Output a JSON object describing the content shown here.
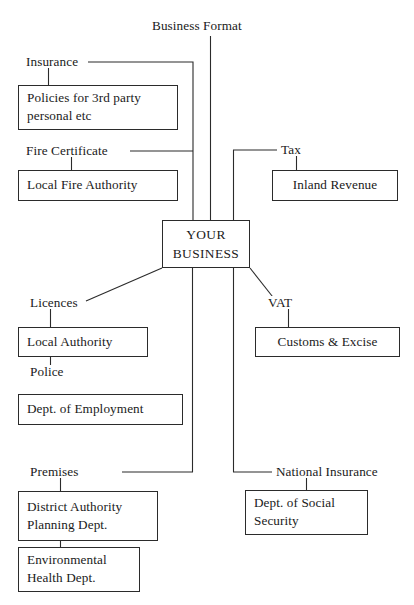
{
  "diagram": {
    "center": {
      "line1": "YOUR",
      "line2": "BUSINESS"
    },
    "labels": {
      "business_format": "Business Format",
      "insurance": "Insurance",
      "fire_certificate": "Fire Certificate",
      "tax": "Tax",
      "licences": "Licences",
      "police": "Police",
      "vat": "VAT",
      "premises": "Premises",
      "national_insurance": "National Insurance"
    },
    "boxes": {
      "policies": {
        "line1": "Policies for 3rd party",
        "line2": "personal etc"
      },
      "local_fire_authority": {
        "line1": "Local Fire Authority"
      },
      "inland_revenue": {
        "line1": "Inland Revenue"
      },
      "local_authority": {
        "line1": "Local Authority"
      },
      "customs_excise": {
        "line1": "Customs & Excise"
      },
      "dept_employment": {
        "line1": "Dept. of Employment"
      },
      "district_authority": {
        "line1": "District Authority",
        "line2": "Planning Dept."
      },
      "environmental_health": {
        "line1": "Environmental",
        "line2": "Health Dept."
      },
      "dept_social_security": {
        "line1": "Dept. of Social",
        "line2": "Security"
      }
    },
    "colors": {
      "stroke": "#2b2b2b",
      "background": "#ffffff",
      "text": "#1a1a1a"
    }
  }
}
